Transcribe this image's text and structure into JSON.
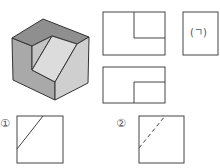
{
  "figure": {
    "type": "orthographic-projection-problem",
    "isometric_view": {
      "colors": {
        "top": "#8f8f8f",
        "left": "#a9a9a9",
        "slant": "#dcdcdc",
        "right": "#cfcfcf",
        "edge": "#333333"
      }
    },
    "views": {
      "front": {
        "label": ""
      },
      "side": {
        "label": "(ㄱ)"
      },
      "top": {
        "label": ""
      }
    },
    "options": [
      {
        "number": "①",
        "line_style": "solid"
      },
      {
        "number": "②",
        "line_style": "dashed"
      }
    ]
  },
  "colors": {
    "line": "#444444",
    "background": "#ffffff"
  }
}
